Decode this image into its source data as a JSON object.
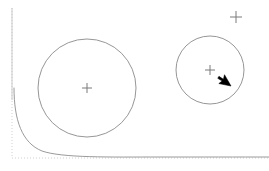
{
  "canvas": {
    "width": 269,
    "height": 171,
    "background_color": "#ffffff",
    "title": "Circle Canvas"
  },
  "colors": {
    "axis_gray": "#c9c9c9",
    "axis_dotted_gray": "#d0d0d0",
    "curve_gray": "#8f8f8f",
    "circle_stroke": "#8a8a8a",
    "cross_stroke": "#7a7a7a",
    "cursor_fill": "#000000",
    "cursor_stroke": "#000000"
  },
  "axes": {
    "y_axis": {
      "label": "y-axis",
      "x": 12,
      "y_top": 8,
      "y_bottom": 158,
      "stroke_width": 1,
      "dash": "1,2"
    },
    "x_axis": {
      "label": "x-axis",
      "y": 158,
      "x_left": 12,
      "x_right": 269,
      "stroke_width": 1,
      "dash": "1,2"
    }
  },
  "curve": {
    "name": "hyperbola-curve",
    "description": "Thin gray curve descending from upper-left, asymptotic to the x-axis toward the right edge",
    "path": "M 14 88 C 14 120 22 143 42 151 C 62 158 110 157 160 157 C 200 157 240 157 269 157",
    "stroke_width": 0.9
  },
  "shapes": [
    {
      "name": "large-circle",
      "type": "circle",
      "cx": 87,
      "cy": 88,
      "r": 49,
      "stroke_width": 0.9
    },
    {
      "name": "small-circle",
      "type": "circle",
      "cx": 210,
      "cy": 70,
      "r": 34,
      "stroke_width": 0.9
    }
  ],
  "markers": [
    {
      "name": "large-circle-center-cross",
      "cx": 87,
      "cy": 88,
      "arm": 5,
      "stroke_width": 1
    },
    {
      "name": "small-circle-center-cross",
      "cx": 210,
      "cy": 70,
      "arm": 5,
      "stroke_width": 1
    },
    {
      "name": "free-cross-top-right",
      "cx": 236,
      "cy": 17,
      "arm": 6,
      "stroke_width": 1
    }
  ],
  "cursor": {
    "name": "mouse-pointer",
    "tip_x": 231,
    "tip_y": 86,
    "path": "M 231 86 L 231 99 L 234.2 95.6 L 236.6 100.4 L 238.6 99.3 L 236.2 94.7 L 240.3 94.2 Z",
    "rotation_deg": 150
  }
}
